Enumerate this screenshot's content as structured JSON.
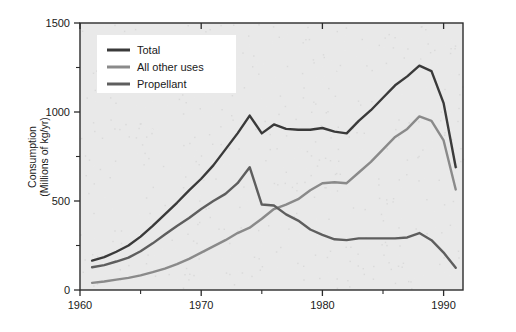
{
  "chart_data": {
    "type": "line",
    "title": "",
    "subtitle": "",
    "xlabel": "",
    "ylabel": "Consumption\n(Millions of kg/yr)",
    "ylabel_line1": "Consumption",
    "ylabel_line2": "(Millions of kg/yr)",
    "xlim": [
      1960,
      1991.6
    ],
    "ylim": [
      0,
      1500
    ],
    "grid": false,
    "legend_position": "top-left",
    "background_color": "#e9e9e9",
    "plot_border_color": "#2b2b2b",
    "x_ticks_major": [
      1960,
      1970,
      1980,
      1990
    ],
    "x_tick_labels": [
      "1960",
      "1970",
      "1980",
      "1990"
    ],
    "x_ticks_minor": [
      1965,
      1975,
      1985
    ],
    "y_ticks_major": [
      0,
      500,
      1000,
      1500
    ],
    "y_tick_labels": [
      "0",
      "500",
      "1000",
      "1500"
    ],
    "y_ticks_minor": [
      250,
      750,
      1250
    ],
    "x": [
      1961,
      1962,
      1963,
      1964,
      1965,
      1966,
      1967,
      1968,
      1969,
      1970,
      1971,
      1972,
      1973,
      1974,
      1975,
      1976,
      1977,
      1978,
      1979,
      1980,
      1981,
      1982,
      1983,
      1984,
      1985,
      1986,
      1987,
      1988,
      1989,
      1990,
      1991
    ],
    "series": [
      {
        "name": "Total",
        "color": "#3a3a3a",
        "values": [
          165,
          185,
          215,
          250,
          300,
          360,
          425,
          490,
          560,
          625,
          700,
          790,
          880,
          980,
          880,
          930,
          905,
          900,
          900,
          910,
          890,
          880,
          950,
          1010,
          1080,
          1150,
          1200,
          1260,
          1230,
          1050,
          690
        ]
      },
      {
        "name": "All other uses",
        "color": "#8a8a8a",
        "values": [
          40,
          48,
          58,
          68,
          82,
          100,
          120,
          145,
          175,
          210,
          245,
          280,
          320,
          350,
          400,
          455,
          480,
          510,
          560,
          600,
          605,
          600,
          660,
          720,
          790,
          860,
          905,
          975,
          950,
          840,
          565
        ]
      },
      {
        "name": "Propellant",
        "color": "#5e5e5e",
        "values": [
          128,
          140,
          160,
          182,
          218,
          262,
          312,
          360,
          405,
          455,
          500,
          540,
          600,
          690,
          480,
          475,
          425,
          390,
          340,
          310,
          285,
          280,
          290,
          290,
          290,
          290,
          295,
          320,
          280,
          210,
          125
        ]
      }
    ],
    "legend_entries": [
      {
        "label": "Total",
        "color": "#3a3a3a"
      },
      {
        "label": "All other uses",
        "color": "#8a8a8a"
      },
      {
        "label": "Propellant",
        "color": "#5e5e5e"
      }
    ]
  }
}
